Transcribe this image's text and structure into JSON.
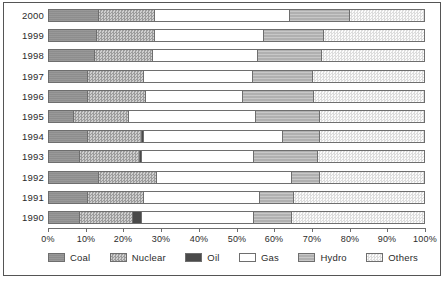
{
  "chart_data": {
    "type": "bar",
    "orientation": "horizontal",
    "stacked": true,
    "normalized": true,
    "title": "",
    "xlabel": "",
    "ylabel": "",
    "xlim": [
      0,
      100
    ],
    "grid": false,
    "legend_position": "bottom",
    "tick_labels": [
      "0%",
      "10%",
      "20%",
      "30%",
      "40%",
      "50%",
      "60%",
      "70%",
      "80%",
      "90%",
      "100%"
    ],
    "tick_values": [
      0,
      10,
      20,
      30,
      40,
      50,
      60,
      70,
      80,
      90,
      100
    ],
    "categories": [
      "2000",
      "1999",
      "1998",
      "1997",
      "1996",
      "1995",
      "1994",
      "1993",
      "1992",
      "1991",
      "1990"
    ],
    "series": [
      {
        "name": "Coal",
        "pattern": "solid-dark-gray",
        "color": "#8d8d8d",
        "values": [
          13.0,
          12.5,
          12.0,
          10.0,
          10.0,
          6.5,
          10.0,
          8.0,
          13.0,
          10.0,
          8.0
        ]
      },
      {
        "name": "Nuclear",
        "pattern": "checkered",
        "color": "#b9b9b9",
        "values": [
          15.0,
          15.5,
          15.5,
          15.0,
          15.5,
          14.5,
          14.5,
          16.0,
          15.5,
          15.0,
          14.0
        ]
      },
      {
        "name": "Oil",
        "pattern": "solid-black",
        "color": "#4a4a4a",
        "values": [
          0.0,
          0.0,
          0.0,
          0.0,
          0.0,
          0.0,
          0.5,
          0.5,
          0.0,
          0.0,
          2.5
        ]
      },
      {
        "name": "Gas",
        "pattern": "white",
        "color": "#ffffff",
        "values": [
          36.0,
          29.0,
          28.0,
          29.0,
          26.0,
          34.0,
          37.0,
          30.0,
          36.0,
          31.0,
          30.0
        ]
      },
      {
        "name": "Hydro",
        "pattern": "light-horizontal-lines",
        "color": "#b0b0b0",
        "values": [
          16.0,
          16.0,
          17.0,
          16.0,
          19.0,
          17.0,
          10.0,
          17.0,
          7.5,
          9.0,
          10.0
        ]
      },
      {
        "name": "Others",
        "pattern": "fine-dots",
        "color": "#ececec",
        "values": [
          20.0,
          27.0,
          27.5,
          30.0,
          29.5,
          28.0,
          28.0,
          28.5,
          28.0,
          35.0,
          35.5
        ]
      }
    ]
  },
  "legend": {
    "items": [
      {
        "label": "Coal"
      },
      {
        "label": "Nuclear"
      },
      {
        "label": "Oil"
      },
      {
        "label": "Gas"
      },
      {
        "label": "Hydro"
      },
      {
        "label": "Others"
      }
    ]
  }
}
